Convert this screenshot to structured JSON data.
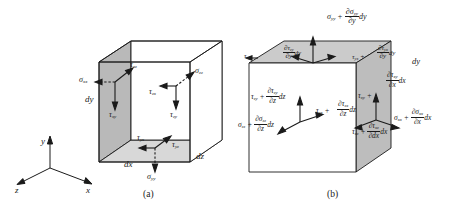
{
  "figure": {
    "captions": {
      "a": "(a)",
      "b": "(b)"
    },
    "colors": {
      "line": "#1a1a1a",
      "face_dark": "#b9b9b9",
      "face_mid": "#cfcfcf",
      "face_light": "#dcdcdc",
      "face_white": "#ffffff",
      "background": "#ffffff"
    }
  },
  "axes": {
    "name": "coordinate-triad",
    "x_label": "x",
    "y_label": "y",
    "z_label": "z"
  },
  "panel_a": {
    "caption": "(a)",
    "description": "Cube with stress components on the negative (back) faces",
    "dimension_labels": {
      "dx": "dx",
      "dy": "dy",
      "dz": "dz"
    },
    "stresses": [
      {
        "id": "sigma-xx",
        "base": "σ",
        "sub": "xx",
        "kind": "normal",
        "face": "x-negative"
      },
      {
        "id": "tau-xz",
        "base": "τ",
        "sub": "xz",
        "kind": "shear",
        "face": "x-negative"
      },
      {
        "id": "tau-xy",
        "base": "τ",
        "sub": "xy",
        "kind": "shear",
        "face": "x-negative"
      },
      {
        "id": "sigma-zz",
        "base": "σ",
        "sub": "zz",
        "kind": "normal",
        "face": "z-negative"
      },
      {
        "id": "tau-zx",
        "base": "τ",
        "sub": "zx",
        "kind": "shear",
        "face": "z-negative"
      },
      {
        "id": "tau-zy",
        "base": "τ",
        "sub": "zy",
        "kind": "shear",
        "face": "z-negative"
      },
      {
        "id": "tau-yx",
        "base": "τ",
        "sub": "yx",
        "kind": "shear",
        "face": "y-negative"
      },
      {
        "id": "tau-yz",
        "base": "τ",
        "sub": "yz",
        "kind": "shear",
        "face": "y-negative"
      },
      {
        "id": "sigma-yy",
        "base": "σ",
        "sub": "yy",
        "kind": "normal",
        "face": "y-negative"
      }
    ]
  },
  "panel_b": {
    "caption": "(b)",
    "description": "Cube with incremented stress components on the positive faces",
    "dimension_labels": {
      "dx": "dx",
      "dy": "dy",
      "dz": "dz"
    },
    "stresses": [
      {
        "id": "sigma-yy-inc",
        "base": "σ",
        "sub": "yy",
        "num_base": "∂σ",
        "num_sub": "yy",
        "den": "∂y",
        "diff": "dy",
        "face": "y-positive"
      },
      {
        "id": "tau-zy-inc-y",
        "base": "τ",
        "sub": "zy",
        "num_base": "∂τ",
        "num_sub": "zy",
        "den": "∂y",
        "diff": "dy",
        "face": "y-positive"
      },
      {
        "id": "tau-yx-inc",
        "base": "τ",
        "sub": "yx",
        "num_base": "∂τ",
        "num_sub": "yx",
        "den": "∂y",
        "diff": "dy",
        "face": "y-positive"
      },
      {
        "id": "tau-zy-inc-z",
        "base": "τ",
        "sub": "zy",
        "num_base": "∂τ",
        "num_sub": "zy",
        "den": "∂z",
        "diff": "dz",
        "face": "z-positive"
      },
      {
        "id": "sigma-zz-inc",
        "base": "σ",
        "sub": "zz",
        "num_base": "∂σ",
        "num_sub": "zz",
        "den": "∂z",
        "diff": "dz",
        "face": "z-positive"
      },
      {
        "id": "tau-zx-inc",
        "base": "τ",
        "sub": "zx",
        "num_base": "∂τ",
        "num_sub": "zx",
        "den": "∂z",
        "diff": "dz",
        "face": "z-positive"
      },
      {
        "id": "tau-xy-inc",
        "base": "τ",
        "sub": "xy",
        "num_base": "∂τ",
        "num_sub": "xy",
        "den": "∂x",
        "diff": "dx",
        "face": "x-positive"
      },
      {
        "id": "sigma-xx-inc",
        "base": "σ",
        "sub": "xx",
        "num_base": "∂σ",
        "num_sub": "xx",
        "den": "∂x",
        "diff": "dx",
        "face": "x-positive"
      },
      {
        "id": "tau-xz-inc",
        "base": "τ",
        "sub": "xz",
        "num_base": "∂τ",
        "num_sub": "xz",
        "den": "∂dx",
        "diff": "dx",
        "face": "x-positive"
      }
    ],
    "corner_labels": [
      {
        "id": "tau-zy-corner",
        "base": "τ",
        "sub": "zy"
      },
      {
        "id": "tau-zx-corner",
        "base": "τ",
        "sub": "zx"
      },
      {
        "id": "tau-xy-corner",
        "base": "τ",
        "sub": "xy"
      }
    ]
  },
  "glyphs": {
    "plus": "+",
    "sigma": "σ",
    "tau": "τ",
    "partial": "∂"
  }
}
